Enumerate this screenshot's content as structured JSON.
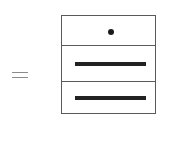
{
  "diagram": {
    "type": "stack-equation",
    "operator": "=",
    "stack": {
      "cells": [
        {
          "content": "dot",
          "icon": "dot-icon"
        },
        {
          "content": "bar",
          "icon": "bar-icon"
        },
        {
          "content": "bar",
          "icon": "bar-icon"
        }
      ]
    },
    "colors": {
      "stroke": "#5a5a5a",
      "fill": "#222222",
      "operator": "#8a8a8a",
      "background": "#ffffff"
    }
  }
}
